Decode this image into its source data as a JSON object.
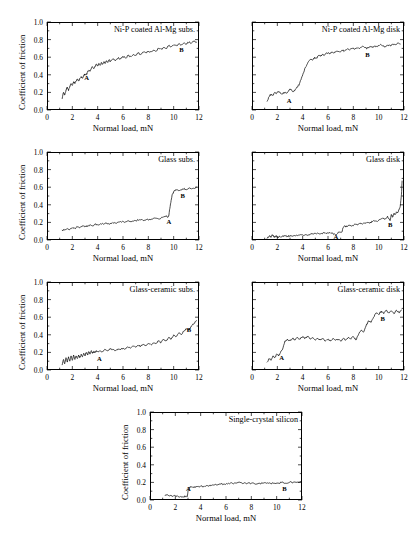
{
  "figure": {
    "axis_x_label": "Normal load, mN",
    "axis_y_label": "Coefficient of friction",
    "x_ticks": [
      "0",
      "2",
      "4",
      "6",
      "8",
      "10",
      "12"
    ],
    "y_ticks": [
      "0.0",
      "0.2",
      "0.4",
      "0.6",
      "0.8",
      "1.0"
    ],
    "point_label_a": "A",
    "point_label_b": "B"
  },
  "chart_data": [
    {
      "type": "line",
      "title": "Ni-P coated Al-Mg subs.",
      "xlabel": "Normal load, mN",
      "ylabel": "Coefficient of friction",
      "xlim": [
        0,
        12
      ],
      "ylim": [
        0.0,
        1.0
      ],
      "xticks": [
        0,
        2,
        4,
        6,
        8,
        10,
        12
      ],
      "yticks": [
        0.0,
        0.2,
        0.4,
        0.6,
        0.8,
        1.0
      ],
      "grid": false,
      "y_axis_labeled": true,
      "x_axis_labeled": true,
      "annotations": [
        {
          "label": "A",
          "x": 3.1,
          "y": 0.36
        },
        {
          "label": "B",
          "x": 10.6,
          "y": 0.68
        }
      ],
      "x": [
        1.2,
        1.3,
        1.4,
        1.5,
        1.6,
        1.7,
        1.8,
        1.9,
        2.0,
        2.1,
        2.2,
        2.3,
        2.4,
        2.5,
        2.6,
        2.7,
        2.8,
        2.9,
        3.0,
        3.1,
        3.2,
        3.3,
        3.4,
        3.5,
        3.6,
        3.7,
        3.8,
        3.9,
        4.0,
        4.1,
        4.2,
        4.3,
        4.4,
        4.5,
        4.6,
        4.7,
        4.8,
        4.9,
        5.0,
        5.2,
        5.4,
        5.6,
        5.8,
        6.0,
        6.2,
        6.4,
        6.6,
        6.8,
        7.0,
        7.2,
        7.4,
        7.6,
        7.8,
        8.0,
        8.2,
        8.4,
        8.6,
        8.8,
        9.0,
        9.2,
        9.4,
        9.6,
        9.8,
        10.0,
        10.2,
        10.4,
        10.6,
        10.8,
        11.0,
        11.2,
        11.4,
        11.6,
        11.8
      ],
      "values": [
        0.13,
        0.2,
        0.17,
        0.23,
        0.26,
        0.22,
        0.27,
        0.3,
        0.28,
        0.32,
        0.3,
        0.33,
        0.35,
        0.33,
        0.36,
        0.38,
        0.36,
        0.39,
        0.41,
        0.4,
        0.43,
        0.45,
        0.44,
        0.47,
        0.49,
        0.47,
        0.5,
        0.52,
        0.5,
        0.53,
        0.51,
        0.54,
        0.52,
        0.55,
        0.53,
        0.56,
        0.54,
        0.57,
        0.55,
        0.58,
        0.56,
        0.59,
        0.58,
        0.61,
        0.59,
        0.62,
        0.61,
        0.63,
        0.62,
        0.65,
        0.63,
        0.66,
        0.65,
        0.67,
        0.66,
        0.68,
        0.67,
        0.7,
        0.69,
        0.71,
        0.7,
        0.73,
        0.72,
        0.74,
        0.73,
        0.75,
        0.74,
        0.76,
        0.75,
        0.77,
        0.76,
        0.78,
        0.77
      ]
    },
    {
      "type": "line",
      "title": "Ni-P coated Al-Mg disk",
      "xlabel": "Normal load, mN",
      "ylabel": "Coefficient of friction",
      "xlim": [
        0,
        12
      ],
      "ylim": [
        0.0,
        1.0
      ],
      "xticks": [
        0,
        2,
        4,
        6,
        8,
        10,
        12
      ],
      "yticks": [
        0.0,
        0.2,
        0.4,
        0.6,
        0.8,
        1.0
      ],
      "grid": false,
      "y_axis_labeled": false,
      "x_axis_labeled": true,
      "annotations": [
        {
          "label": "A",
          "x": 2.9,
          "y": 0.1
        },
        {
          "label": "B",
          "x": 9.1,
          "y": 0.62
        }
      ],
      "x": [
        1.2,
        1.35,
        1.5,
        1.65,
        1.8,
        1.95,
        2.1,
        2.25,
        2.4,
        2.55,
        2.7,
        2.85,
        3.0,
        3.15,
        3.3,
        3.45,
        3.6,
        3.75,
        3.9,
        4.05,
        4.2,
        4.35,
        4.5,
        4.65,
        4.8,
        4.95,
        5.1,
        5.25,
        5.4,
        5.55,
        5.7,
        5.9,
        6.1,
        6.3,
        6.5,
        6.7,
        6.9,
        7.1,
        7.3,
        7.5,
        7.7,
        7.9,
        8.1,
        8.3,
        8.5,
        8.7,
        8.9,
        9.1,
        9.3,
        9.5,
        9.7,
        9.9,
        10.1,
        10.3,
        10.5,
        10.7,
        10.9,
        11.1,
        11.3,
        11.5,
        11.7
      ],
      "values": [
        0.1,
        0.15,
        0.18,
        0.17,
        0.2,
        0.19,
        0.21,
        0.19,
        0.18,
        0.2,
        0.19,
        0.21,
        0.24,
        0.22,
        0.21,
        0.24,
        0.26,
        0.3,
        0.36,
        0.42,
        0.48,
        0.52,
        0.56,
        0.58,
        0.57,
        0.6,
        0.59,
        0.62,
        0.61,
        0.63,
        0.62,
        0.65,
        0.64,
        0.66,
        0.65,
        0.67,
        0.66,
        0.68,
        0.67,
        0.69,
        0.68,
        0.7,
        0.69,
        0.71,
        0.7,
        0.72,
        0.71,
        0.7,
        0.72,
        0.71,
        0.73,
        0.72,
        0.74,
        0.73,
        0.72,
        0.74,
        0.73,
        0.75,
        0.74,
        0.76,
        0.75
      ]
    },
    {
      "type": "line",
      "title": "Glass subs.",
      "xlabel": "Normal load, mN",
      "ylabel": "Coefficient of friction",
      "xlim": [
        0,
        12
      ],
      "ylim": [
        0.0,
        1.0
      ],
      "xticks": [
        0,
        2,
        4,
        6,
        8,
        10,
        12
      ],
      "yticks": [
        0.0,
        0.2,
        0.4,
        0.6,
        0.8,
        1.0
      ],
      "grid": false,
      "y_axis_labeled": true,
      "x_axis_labeled": true,
      "annotations": [
        {
          "label": "A",
          "x": 9.6,
          "y": 0.2
        },
        {
          "label": "B",
          "x": 10.7,
          "y": 0.5
        }
      ],
      "x": [
        1.2,
        1.4,
        1.6,
        1.8,
        2.0,
        2.2,
        2.4,
        2.6,
        2.8,
        3.0,
        3.2,
        3.4,
        3.6,
        3.8,
        4.0,
        4.3,
        4.6,
        4.9,
        5.2,
        5.5,
        5.8,
        6.1,
        6.4,
        6.7,
        7.0,
        7.3,
        7.6,
        7.9,
        8.2,
        8.5,
        8.8,
        9.0,
        9.2,
        9.4,
        9.5,
        9.6,
        9.7,
        9.8,
        9.9,
        10.0,
        10.2,
        10.4,
        10.6,
        10.8,
        11.0,
        11.2,
        11.4,
        11.6,
        11.8
      ],
      "values": [
        0.11,
        0.12,
        0.13,
        0.12,
        0.14,
        0.13,
        0.15,
        0.14,
        0.16,
        0.15,
        0.16,
        0.17,
        0.16,
        0.18,
        0.17,
        0.18,
        0.19,
        0.18,
        0.2,
        0.19,
        0.21,
        0.2,
        0.22,
        0.21,
        0.22,
        0.23,
        0.22,
        0.24,
        0.23,
        0.25,
        0.24,
        0.25,
        0.26,
        0.27,
        0.26,
        0.27,
        0.36,
        0.45,
        0.52,
        0.55,
        0.57,
        0.56,
        0.57,
        0.58,
        0.57,
        0.59,
        0.58,
        0.59,
        0.6
      ]
    },
    {
      "type": "line",
      "title": "Glass disk",
      "xlabel": "Normal load, mN",
      "ylabel": "Coefficient of friction",
      "xlim": [
        0,
        12
      ],
      "ylim": [
        0.0,
        1.0
      ],
      "xticks": [
        0,
        2,
        4,
        6,
        8,
        10,
        12
      ],
      "yticks": [
        0.0,
        0.2,
        0.4,
        0.6,
        0.8,
        1.0
      ],
      "grid": false,
      "y_axis_labeled": false,
      "x_axis_labeled": true,
      "annotations": [
        {
          "label": "A",
          "x": 6.6,
          "y": 0.035
        },
        {
          "label": "B",
          "x": 10.9,
          "y": 0.17
        }
      ],
      "x": [
        1.2,
        1.4,
        1.5,
        1.6,
        1.7,
        1.8,
        1.9,
        2.0,
        2.2,
        2.4,
        2.6,
        2.8,
        3.0,
        3.3,
        3.6,
        3.9,
        4.2,
        4.5,
        4.8,
        5.1,
        5.4,
        5.7,
        6.0,
        6.3,
        6.6,
        6.9,
        7.1,
        7.2,
        7.3,
        7.5,
        7.7,
        7.9,
        8.1,
        8.3,
        8.5,
        8.7,
        8.9,
        9.1,
        9.3,
        9.5,
        9.7,
        9.9,
        10.1,
        10.3,
        10.5,
        10.7,
        10.9,
        11.0,
        11.1,
        11.2,
        11.3,
        11.4,
        11.5,
        11.6,
        11.7,
        11.8,
        11.85
      ],
      "values": [
        0.02,
        0.05,
        0.03,
        0.06,
        0.04,
        0.03,
        0.05,
        0.03,
        0.04,
        0.04,
        0.05,
        0.04,
        0.05,
        0.05,
        0.05,
        0.06,
        0.06,
        0.06,
        0.07,
        0.07,
        0.07,
        0.08,
        0.08,
        0.08,
        0.06,
        0.09,
        0.09,
        0.14,
        0.16,
        0.15,
        0.17,
        0.16,
        0.18,
        0.17,
        0.19,
        0.18,
        0.19,
        0.2,
        0.19,
        0.21,
        0.22,
        0.21,
        0.23,
        0.25,
        0.24,
        0.27,
        0.22,
        0.29,
        0.26,
        0.3,
        0.29,
        0.32,
        0.31,
        0.34,
        0.38,
        0.52,
        0.67
      ]
    },
    {
      "type": "line",
      "title": "Glass-ceramic subs.",
      "xlabel": "Normal load, mN",
      "ylabel": "Coefficient of friction",
      "xlim": [
        0,
        12
      ],
      "ylim": [
        0.0,
        1.0
      ],
      "xticks": [
        0,
        2,
        4,
        6,
        8,
        10,
        12
      ],
      "yticks": [
        0.0,
        0.2,
        0.4,
        0.6,
        0.8,
        1.0
      ],
      "grid": false,
      "y_axis_labeled": true,
      "x_axis_labeled": true,
      "annotations": [
        {
          "label": "A",
          "x": 4.1,
          "y": 0.12
        },
        {
          "label": "B",
          "x": 11.2,
          "y": 0.46
        }
      ],
      "x": [
        1.2,
        1.3,
        1.4,
        1.5,
        1.6,
        1.7,
        1.8,
        1.9,
        2.0,
        2.1,
        2.2,
        2.3,
        2.4,
        2.5,
        2.6,
        2.7,
        2.8,
        2.9,
        3.0,
        3.1,
        3.2,
        3.3,
        3.4,
        3.5,
        3.6,
        3.7,
        3.8,
        3.9,
        4.0,
        4.2,
        4.4,
        4.6,
        4.8,
        5.0,
        5.2,
        5.4,
        5.6,
        5.8,
        6.0,
        6.2,
        6.4,
        6.6,
        6.8,
        7.0,
        7.2,
        7.4,
        7.6,
        7.8,
        8.0,
        8.2,
        8.4,
        8.6,
        8.8,
        9.0,
        9.2,
        9.4,
        9.6,
        9.8,
        10.0,
        10.2,
        10.4,
        10.6,
        10.8,
        11.0,
        11.2,
        11.4,
        11.6,
        11.8
      ],
      "values": [
        0.06,
        0.12,
        0.07,
        0.14,
        0.09,
        0.15,
        0.1,
        0.16,
        0.11,
        0.17,
        0.12,
        0.16,
        0.13,
        0.17,
        0.14,
        0.18,
        0.15,
        0.19,
        0.16,
        0.2,
        0.17,
        0.21,
        0.18,
        0.22,
        0.19,
        0.21,
        0.2,
        0.22,
        0.21,
        0.22,
        0.21,
        0.23,
        0.22,
        0.24,
        0.23,
        0.22,
        0.24,
        0.23,
        0.25,
        0.24,
        0.26,
        0.25,
        0.27,
        0.26,
        0.28,
        0.27,
        0.29,
        0.28,
        0.3,
        0.29,
        0.31,
        0.3,
        0.33,
        0.31,
        0.35,
        0.33,
        0.37,
        0.35,
        0.4,
        0.38,
        0.42,
        0.4,
        0.44,
        0.47,
        0.45,
        0.5,
        0.53,
        0.56
      ]
    },
    {
      "type": "line",
      "title": "Glass-ceramic disk",
      "xlabel": "Normal load, mN",
      "ylabel": "Coefficient of friction",
      "xlim": [
        0,
        12
      ],
      "ylim": [
        0.0,
        1.0
      ],
      "xticks": [
        0,
        2,
        4,
        6,
        8,
        10,
        12
      ],
      "yticks": [
        0.0,
        0.2,
        0.4,
        0.6,
        0.8,
        1.0
      ],
      "grid": false,
      "y_axis_labeled": false,
      "x_axis_labeled": true,
      "annotations": [
        {
          "label": "A",
          "x": 2.3,
          "y": 0.14
        },
        {
          "label": "B",
          "x": 10.3,
          "y": 0.58
        }
      ],
      "x": [
        1.2,
        1.35,
        1.5,
        1.65,
        1.8,
        1.95,
        2.1,
        2.25,
        2.4,
        2.6,
        2.8,
        3.0,
        3.2,
        3.4,
        3.6,
        3.8,
        4.0,
        4.2,
        4.4,
        4.6,
        4.8,
        5.0,
        5.2,
        5.4,
        5.6,
        5.8,
        6.0,
        6.2,
        6.4,
        6.6,
        6.8,
        7.0,
        7.2,
        7.4,
        7.6,
        7.8,
        8.0,
        8.2,
        8.4,
        8.6,
        8.8,
        9.0,
        9.2,
        9.4,
        9.6,
        9.8,
        10.0,
        10.2,
        10.4,
        10.6,
        10.8,
        11.0,
        11.2,
        11.4,
        11.6,
        11.8
      ],
      "values": [
        0.09,
        0.13,
        0.11,
        0.16,
        0.14,
        0.18,
        0.16,
        0.2,
        0.23,
        0.33,
        0.35,
        0.33,
        0.36,
        0.34,
        0.37,
        0.35,
        0.38,
        0.36,
        0.38,
        0.35,
        0.37,
        0.34,
        0.36,
        0.34,
        0.36,
        0.33,
        0.35,
        0.33,
        0.36,
        0.34,
        0.35,
        0.33,
        0.36,
        0.34,
        0.37,
        0.35,
        0.38,
        0.34,
        0.4,
        0.45,
        0.43,
        0.5,
        0.56,
        0.54,
        0.6,
        0.65,
        0.63,
        0.67,
        0.64,
        0.68,
        0.65,
        0.67,
        0.64,
        0.68,
        0.65,
        0.68
      ]
    },
    {
      "type": "line",
      "title": "Single-crystal silicon",
      "xlabel": "Normal load, mN",
      "ylabel": "Coefficient of friction",
      "xlim": [
        0,
        12
      ],
      "ylim": [
        0.0,
        1.0
      ],
      "xticks": [
        0,
        2,
        4,
        6,
        8,
        10,
        12
      ],
      "yticks": [
        0.0,
        0.2,
        0.4,
        0.6,
        0.8,
        1.0
      ],
      "grid": false,
      "y_axis_labeled": true,
      "x_axis_labeled": true,
      "annotations": [
        {
          "label": "A",
          "x": 3.0,
          "y": 0.13
        },
        {
          "label": "B",
          "x": 10.6,
          "y": 0.13
        }
      ],
      "x": [
        1.2,
        1.4,
        1.6,
        1.8,
        2.0,
        2.2,
        2.4,
        2.6,
        2.8,
        2.95,
        3.0,
        3.1,
        3.2,
        3.4,
        3.6,
        3.8,
        4.0,
        4.2,
        4.4,
        4.6,
        4.8,
        5.0,
        5.3,
        5.6,
        5.9,
        6.2,
        6.5,
        6.8,
        7.1,
        7.4,
        7.7,
        8.0,
        8.3,
        8.6,
        8.9,
        9.2,
        9.5,
        9.8,
        10.1,
        10.4,
        10.7,
        11.0,
        11.3,
        11.6,
        11.9
      ],
      "values": [
        0.05,
        0.06,
        0.05,
        0.04,
        0.05,
        0.04,
        0.04,
        0.04,
        0.04,
        0.04,
        0.1,
        0.14,
        0.15,
        0.14,
        0.15,
        0.15,
        0.16,
        0.15,
        0.16,
        0.16,
        0.17,
        0.17,
        0.17,
        0.18,
        0.18,
        0.19,
        0.19,
        0.19,
        0.2,
        0.19,
        0.19,
        0.19,
        0.18,
        0.19,
        0.19,
        0.19,
        0.19,
        0.19,
        0.19,
        0.2,
        0.19,
        0.2,
        0.2,
        0.2,
        0.21
      ]
    }
  ]
}
